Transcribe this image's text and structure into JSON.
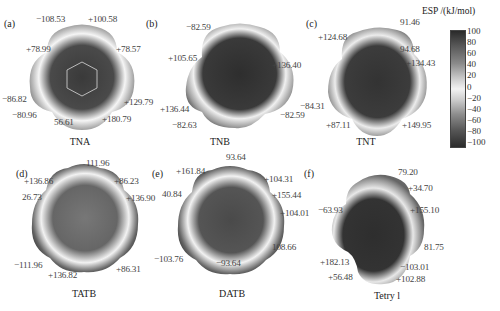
{
  "colorbar": {
    "title": "ESP /(kJ/mol)",
    "ticks": [
      "100",
      "80",
      "60",
      "40",
      "20",
      "0",
      "−20",
      "−40",
      "−60",
      "−80",
      "−100"
    ],
    "range": [
      -100,
      100
    ]
  },
  "panels": [
    {
      "label": "(a)",
      "name": "TNA",
      "values": [
        "−108.53",
        "+100.58",
        "+78.99",
        "+78.57",
        "−86.82",
        "+129.79",
        "−80.96",
        "56.61",
        "+180.79"
      ]
    },
    {
      "label": "(b)",
      "name": "TNB",
      "values": [
        "−82.59",
        "+105.65",
        "+136.40",
        "+136.44",
        "−82.63",
        "−82.59"
      ]
    },
    {
      "label": "(c)",
      "name": "TNT",
      "values": [
        "91.46",
        "+124.68",
        "94.68",
        "+134.43",
        "−84.31",
        "+87.11",
        "+149.95"
      ]
    },
    {
      "label": "(d)",
      "name": "TATB",
      "values": [
        "111.96",
        "+136.86",
        "+86.23",
        "26.73",
        "+136.90",
        "−111.96",
        "+136.82",
        "+86.31"
      ]
    },
    {
      "label": "(e)",
      "name": "DATB",
      "values": [
        "93.64",
        "+161.84",
        "+104.31",
        "40.84",
        "+155.44",
        "+104.01",
        "−103.76",
        "108.66",
        "−93.64"
      ]
    },
    {
      "label": "(f)",
      "name": "Tetry l",
      "values": [
        "79.20",
        "+34.70",
        "−63.93",
        "+155.10",
        "81.75",
        "+182.13",
        "−103.01",
        "+56.48",
        "+102.88"
      ]
    }
  ]
}
